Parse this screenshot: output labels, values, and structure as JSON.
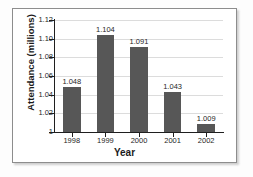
{
  "chart_data": {
    "type": "bar",
    "title": "",
    "categories": [
      "1998",
      "1999",
      "2000",
      "2001",
      "2002"
    ],
    "values": [
      1.048,
      1.104,
      1.091,
      1.043,
      1.009
    ],
    "value_labels": [
      "1.048",
      "1.104",
      "1.091",
      "1.043",
      "1.009"
    ],
    "xlabel": "Year",
    "ylabel": "Attendance (millions)",
    "ylim": [
      1.0,
      1.12
    ],
    "ytick_values": [
      1.0,
      1.02,
      1.04,
      1.06,
      1.08,
      1.1,
      1.12
    ],
    "ytick_labels": [
      "1",
      "1.02",
      "1.04",
      "1.06",
      "1.08",
      "1.10",
      "1.12"
    ],
    "grid": true,
    "legend": false,
    "bar_color": "#575757",
    "grid_color": "#dcdcdc",
    "axis_color": "#1f1f1f",
    "text_color": "#262626",
    "background_color": "#ffffff",
    "frame_border_color": "#8d8d8d"
  }
}
